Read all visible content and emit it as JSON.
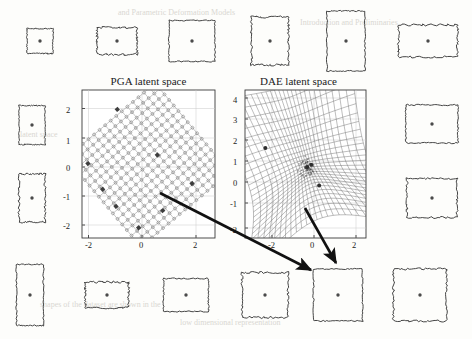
{
  "figure": {
    "background_color": "#fdfdfb",
    "ink_color": "#1b1b1b",
    "faint_text_color": "#d9d7d2"
  },
  "panels": [
    {
      "id": "pga",
      "title": "PGA latent space",
      "plot_type": "grid-2d",
      "x_ticks": [
        "-2",
        "0",
        "2"
      ],
      "y_ticks": [
        "2",
        "1",
        "0",
        "-1",
        "-2"
      ]
    },
    {
      "id": "dae",
      "title": "DAE latent space",
      "plot_type": "surface-mesh-3d",
      "x_ticks": [
        "-2",
        "0",
        "2"
      ],
      "y_ticks": [
        "4",
        "3",
        "2",
        "1",
        "0",
        "-1",
        "-2"
      ]
    }
  ],
  "chart_data": [
    {
      "type": "scatter",
      "id": "pga-latent-space",
      "title": "PGA latent space",
      "xlabel": "",
      "ylabel": "",
      "xlim": [
        -3,
        3
      ],
      "ylim": [
        -2.6,
        2.6
      ],
      "xticks": [
        -2,
        0,
        2
      ],
      "yticks": [
        -2,
        -1,
        0,
        1,
        2
      ],
      "grid": true,
      "description": "A regular square lattice of sample points rotated roughly 40 degrees, filling most of the latent plane; highlighted samples sit on the lattice boundary.",
      "lattice": {
        "rotation_deg": -40,
        "rows": 17,
        "cols": 17,
        "extent": [
          -2.3,
          2.3
        ]
      },
      "highlighted_points": [
        {
          "x": -2.25,
          "y": 0.05
        },
        {
          "x": -1.15,
          "y": 1.95
        },
        {
          "x": -1.7,
          "y": -0.85
        },
        {
          "x": -1.2,
          "y": -1.45
        },
        {
          "x": -0.35,
          "y": -2.2
        },
        {
          "x": 0.55,
          "y": -1.6
        },
        {
          "x": 1.65,
          "y": -0.65
        },
        {
          "x": 0.35,
          "y": 0.35
        }
      ]
    },
    {
      "type": "surface",
      "id": "dae-latent-space",
      "title": "DAE latent space",
      "xlabel": "",
      "ylabel": "",
      "xlim": [
        -3.2,
        3.2
      ],
      "ylim": [
        -2.2,
        4.2
      ],
      "xticks": [
        -2,
        0,
        2
      ],
      "yticks": [
        -2,
        -1,
        0,
        1,
        2,
        3,
        4
      ],
      "grid": true,
      "description": "A strongly warped saddle-shaped wireframe manifold rendered as a dense mesh, pinched near the centre with a dark concentration of samples and flaring outward toward the top and bottom corners.",
      "highlighted_points": [
        {
          "x": -1.75,
          "y": 1.6
        },
        {
          "x": 0.35,
          "y": -1.55
        },
        {
          "x": 0.05,
          "y": 0.1
        },
        {
          "x": 0.45,
          "y": 0.2
        }
      ]
    }
  ],
  "shapes": {
    "top_row": [
      {
        "name": "shape-square-small",
        "w": 26,
        "h": 25
      },
      {
        "name": "shape-rect-wide-small",
        "w": 40,
        "h": 27
      },
      {
        "name": "shape-square-medium",
        "w": 46,
        "h": 41
      },
      {
        "name": "shape-rect-tall-medium",
        "w": 37,
        "h": 48
      },
      {
        "name": "shape-rect-tall-large",
        "w": 38,
        "h": 60
      },
      {
        "name": "shape-rect-wide-large",
        "w": 59,
        "h": 32
      }
    ],
    "left_column": [
      {
        "name": "shape-rect-tall-left-upper",
        "w": 26,
        "h": 39
      },
      {
        "name": "shape-rect-tall-left-lower",
        "w": 26,
        "h": 48
      }
    ],
    "right_column": [
      {
        "name": "shape-rect-wide-right-upper",
        "w": 52,
        "h": 38
      },
      {
        "name": "shape-rect-wide-right-lower",
        "w": 50,
        "h": 39
      }
    ],
    "bottom_row": [
      {
        "name": "shape-rect-tall-bottom-1",
        "w": 27,
        "h": 61
      },
      {
        "name": "shape-rect-wide-bottom-2",
        "w": 43,
        "h": 26
      },
      {
        "name": "shape-rect-wide-bottom-3",
        "w": 45,
        "h": 33
      },
      {
        "name": "shape-square-bottom-4",
        "w": 46,
        "h": 45
      },
      {
        "name": "shape-square-bottom-5",
        "w": 49,
        "h": 52
      },
      {
        "name": "shape-square-bottom-6",
        "w": 53,
        "h": 52
      }
    ]
  },
  "arrows": [
    {
      "name": "arrow-pga-to-reconstruction",
      "from": {
        "x": 160,
        "y": 193
      },
      "to": {
        "x": 315,
        "y": 272
      }
    },
    {
      "name": "arrow-dae-to-reconstruction",
      "from": {
        "x": 305,
        "y": 208
      },
      "to": {
        "x": 338,
        "y": 265
      }
    }
  ],
  "background_text": {
    "top_line": "and Parametric Deformation Models",
    "upper_mid": "Introduction and Preliminaries",
    "mid_line": "latent space",
    "lower_line": "shapes of the dataset are shown in the",
    "bottom_line": "low dimensional representation"
  }
}
